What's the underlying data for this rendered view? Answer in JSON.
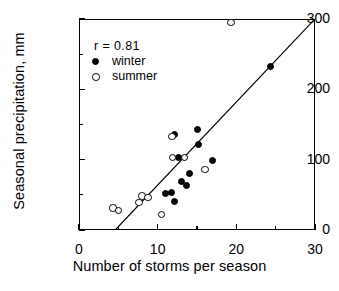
{
  "chart_data": {
    "type": "scatter",
    "title": "",
    "xlabel": "Number of storms per season",
    "ylabel": "Seasonal precipitation, mm",
    "xlim": [
      0,
      30
    ],
    "ylim": [
      0,
      300
    ],
    "xticks": [
      0,
      10,
      20,
      30
    ],
    "xticks_minor": [
      5,
      15,
      25
    ],
    "yticks": [
      0,
      100,
      200,
      300
    ],
    "yticks_minor": [
      50,
      150,
      250
    ],
    "xtick_labels": [
      "0",
      "10",
      "20",
      "30"
    ],
    "ytick_labels": [
      "0",
      "100",
      "200",
      "300"
    ],
    "grid": false,
    "legend_position": "top-left",
    "annotation": "r  =  0.81",
    "correlation": 0.81,
    "series": [
      {
        "name": "winter",
        "marker": "filled-circle",
        "color": "#000000",
        "points": [
          {
            "x": 11.0,
            "y": 52
          },
          {
            "x": 11.7,
            "y": 53
          },
          {
            "x": 12.1,
            "y": 41
          },
          {
            "x": 12.2,
            "y": 136
          },
          {
            "x": 12.6,
            "y": 103
          },
          {
            "x": 13.0,
            "y": 69
          },
          {
            "x": 13.7,
            "y": 63
          },
          {
            "x": 14.1,
            "y": 81
          },
          {
            "x": 15.1,
            "y": 143
          },
          {
            "x": 15.2,
            "y": 122
          },
          {
            "x": 17.0,
            "y": 99
          },
          {
            "x": 24.4,
            "y": 232
          }
        ]
      },
      {
        "name": "summer",
        "marker": "open-circle",
        "color": "#000000",
        "points": [
          {
            "x": 4.3,
            "y": 31
          },
          {
            "x": 5.0,
            "y": 28
          },
          {
            "x": 7.6,
            "y": 39
          },
          {
            "x": 8.0,
            "y": 48
          },
          {
            "x": 8.8,
            "y": 46
          },
          {
            "x": 10.5,
            "y": 22
          },
          {
            "x": 11.8,
            "y": 133
          },
          {
            "x": 11.9,
            "y": 103
          },
          {
            "x": 13.4,
            "y": 103
          },
          {
            "x": 16.0,
            "y": 86
          },
          {
            "x": 19.3,
            "y": 295
          }
        ]
      }
    ],
    "regression_line": {
      "x_start": 4.6,
      "y_start": 0,
      "x_end": 30.0,
      "y_end": 300,
      "color": "#000000"
    }
  },
  "legend": {
    "items": [
      {
        "label": "winter",
        "marker": "filled-circle"
      },
      {
        "label": "summer",
        "marker": "open-circle"
      }
    ]
  }
}
